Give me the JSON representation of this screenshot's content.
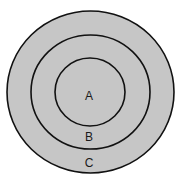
{
  "diagram": {
    "type": "concentric-circles",
    "fill_color": "#c6c6c6",
    "stroke_color": "#111111",
    "regions": [
      {
        "label": "A",
        "position": "inner"
      },
      {
        "label": "B",
        "position": "middle"
      },
      {
        "label": "C",
        "position": "outer"
      }
    ]
  }
}
